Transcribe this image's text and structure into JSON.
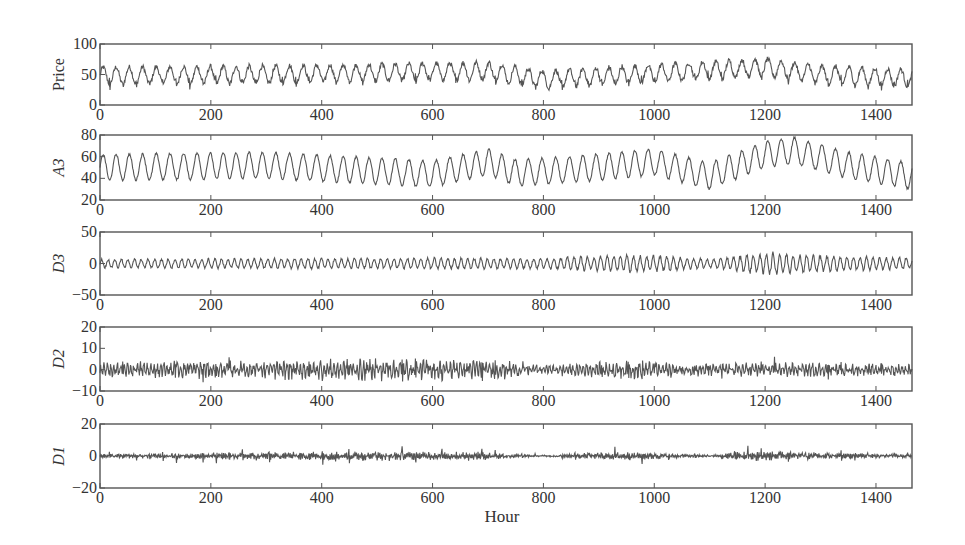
{
  "figure": {
    "xlabel": "Hour",
    "line_color": "#555555",
    "axis_color": "#555555",
    "text_color": "#333333"
  },
  "chart_data": [
    {
      "type": "line",
      "ylabel": "Price",
      "ylabel_italic": false,
      "xlim": [
        0,
        1465
      ],
      "ylim": [
        0,
        100
      ],
      "yticks": [
        0,
        50,
        100
      ],
      "xticks": [
        0,
        200,
        400,
        600,
        800,
        1000,
        1200,
        1400
      ],
      "description": "Hourly electricity price with daily (~24h) oscillation between ~30 and ~75, spikes near 100 around hour 1000 and 1170-1250",
      "signal": {
        "base": 48,
        "trend": [
          [
            0,
            48
          ],
          [
            300,
            50
          ],
          [
            700,
            56
          ],
          [
            800,
            42
          ],
          [
            1000,
            52
          ],
          [
            1200,
            62
          ],
          [
            1300,
            50
          ],
          [
            1465,
            44
          ]
        ],
        "period": 24,
        "amp": 14,
        "spike": 10,
        "noise": 4
      }
    },
    {
      "type": "line",
      "ylabel": "A3",
      "ylabel_italic": true,
      "xlim": [
        0,
        1465
      ],
      "ylim": [
        20,
        80
      ],
      "yticks": [
        20,
        40,
        60,
        80
      ],
      "xticks": [
        0,
        200,
        400,
        600,
        800,
        1000,
        1200,
        1400
      ],
      "description": "Level-3 approximation: smooth daily oscillation 35-70, rising to peak ~75 near hour 1200-1240",
      "signal": {
        "base": 50,
        "trend": [
          [
            0,
            50
          ],
          [
            300,
            52
          ],
          [
            600,
            44
          ],
          [
            700,
            55
          ],
          [
            750,
            45
          ],
          [
            850,
            48
          ],
          [
            1000,
            55
          ],
          [
            1100,
            42
          ],
          [
            1200,
            62
          ],
          [
            1250,
            66
          ],
          [
            1350,
            52
          ],
          [
            1465,
            42
          ]
        ],
        "period": 24,
        "amp": 12,
        "spike": 0,
        "noise": 1
      }
    },
    {
      "type": "line",
      "ylabel": "D3",
      "ylabel_italic": true,
      "xlim": [
        0,
        1465
      ],
      "ylim": [
        -50,
        50
      ],
      "yticks": [
        -50,
        0,
        50
      ],
      "xticks": [
        0,
        200,
        400,
        600,
        800,
        1000,
        1200,
        1400
      ],
      "description": "Level-3 detail: oscillation about 0 with amplitude ~10, bursts to ~25 near hours 1000 and 1150-1250",
      "signal": {
        "base": 0,
        "trend": [
          [
            0,
            0
          ],
          [
            1465,
            0
          ]
        ],
        "period": 12,
        "amp": 8,
        "envelope": [
          [
            0,
            0.8
          ],
          [
            600,
            1
          ],
          [
            800,
            0.9
          ],
          [
            950,
            1.6
          ],
          [
            1050,
            1.2
          ],
          [
            1100,
            0.7
          ],
          [
            1200,
            2.0
          ],
          [
            1300,
            1.4
          ],
          [
            1465,
            1
          ]
        ],
        "spike": 0,
        "noise": 2
      }
    },
    {
      "type": "line",
      "ylabel": "D2",
      "ylabel_italic": true,
      "xlim": [
        0,
        1465
      ],
      "ylim": [
        -10,
        20
      ],
      "yticks": [
        -10,
        0,
        10,
        20
      ],
      "xticks": [
        0,
        200,
        400,
        600,
        800,
        1000,
        1200,
        1400
      ],
      "description": "Level-2 detail: high-frequency noise about 0, amplitude ~3-8 with daily spikes",
      "signal": {
        "base": 0,
        "trend": [
          [
            0,
            0
          ],
          [
            1465,
            0
          ]
        ],
        "period": 6,
        "amp": 2,
        "envelope": [
          [
            0,
            1
          ],
          [
            500,
            1.4
          ],
          [
            750,
            1.2
          ],
          [
            800,
            0.5
          ],
          [
            950,
            1.2
          ],
          [
            1100,
            0.8
          ],
          [
            1200,
            1.0
          ],
          [
            1465,
            0.7
          ]
        ],
        "spike": 6,
        "noise": 2
      }
    },
    {
      "type": "line",
      "ylabel": "D1",
      "ylabel_italic": true,
      "xlim": [
        0,
        1465
      ],
      "ylim": [
        -20,
        20
      ],
      "yticks": [
        -20,
        0,
        20
      ],
      "xticks": [
        0,
        200,
        400,
        600,
        800,
        1000,
        1200,
        1400
      ],
      "description": "Level-1 detail: near-zero with intermittent bursts of amplitude ~5-10",
      "signal": {
        "base": 0,
        "trend": [
          [
            0,
            0
          ],
          [
            1465,
            0
          ]
        ],
        "period": 3,
        "amp": 1,
        "envelope": [
          [
            0,
            0.6
          ],
          [
            420,
            1.4
          ],
          [
            700,
            1.2
          ],
          [
            780,
            0.3
          ],
          [
            950,
            1.3
          ],
          [
            1100,
            0.3
          ],
          [
            1180,
            1.8
          ],
          [
            1300,
            1
          ],
          [
            1465,
            0.6
          ]
        ],
        "spike": 5,
        "noise": 1.2
      }
    }
  ]
}
